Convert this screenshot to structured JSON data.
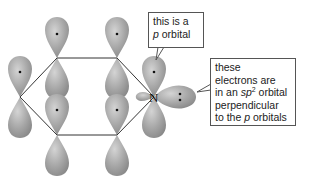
{
  "diagram": {
    "atom_label": "N",
    "lobe_color": "#a9a9a9",
    "bond_color": "#333333",
    "callouts": [
      {
        "id": "p-orbital-callout",
        "line1": "this is a",
        "line2_italic": "p",
        "line2_rest": " orbital"
      },
      {
        "id": "sp2-callout",
        "line1": "these",
        "line2": "electrons are",
        "line3_pre": "in an ",
        "line3_italic": "sp",
        "line3_sup": "2",
        "line3_post": " orbital",
        "line4": "perpendicular",
        "line5_pre": "to the ",
        "line5_italic": "p",
        "line5_post": " orbitals"
      }
    ]
  }
}
